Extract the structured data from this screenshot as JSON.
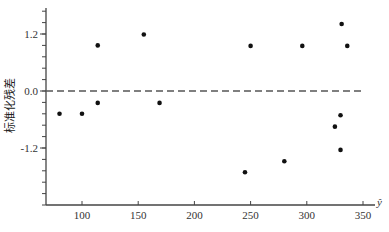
{
  "chart_data": {
    "type": "scatter",
    "title": "",
    "xlabel": "ŷ",
    "ylabel": "标准化残差",
    "xlim": [
      68,
      378
    ],
    "ylim": [
      -2.4,
      1.8
    ],
    "x_ticks": [
      100,
      150,
      200,
      250,
      300,
      350
    ],
    "x_tick_labels": [
      "100",
      "150",
      "200",
      "250",
      "300",
      "350"
    ],
    "y_ticks": [
      1.2,
      0.0,
      -1.2
    ],
    "y_tick_labels": [
      "1.2",
      "0.0",
      "-1.2"
    ],
    "y_minor_step": 0.24,
    "grid": false,
    "reference_line": {
      "y": 0.0,
      "style": "dashed"
    },
    "points": [
      {
        "x": 80,
        "y": -0.48
      },
      {
        "x": 100,
        "y": -0.48
      },
      {
        "x": 114,
        "y": 0.96
      },
      {
        "x": 114,
        "y": -0.25
      },
      {
        "x": 155,
        "y": 1.19
      },
      {
        "x": 169,
        "y": -0.25
      },
      {
        "x": 245,
        "y": -1.71
      },
      {
        "x": 250,
        "y": 0.95
      },
      {
        "x": 280,
        "y": -1.48
      },
      {
        "x": 296,
        "y": 0.95
      },
      {
        "x": 325,
        "y": -0.75
      },
      {
        "x": 330,
        "y": -0.51
      },
      {
        "x": 330,
        "y": -1.24
      },
      {
        "x": 331,
        "y": 1.41
      },
      {
        "x": 336,
        "y": 0.95
      }
    ]
  },
  "colors": {
    "axis": "#444444",
    "point": "#111111",
    "dash": "#555555"
  }
}
